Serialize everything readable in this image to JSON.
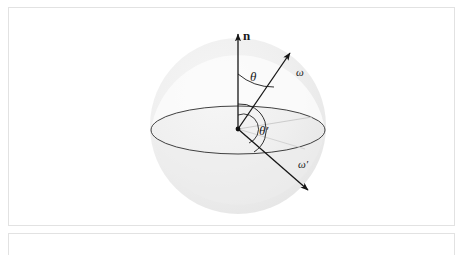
{
  "figure": {
    "caption": "",
    "type": "bsdf-hemisphere-geometry-diagram",
    "colors": {
      "sphere_fill": "#ebebeb",
      "sphere_fill_light": "#f4f4f4",
      "stroke": "#1a1a1a",
      "equator_stroke": "#2b2b2b",
      "projection_line": "#c9c9c9",
      "panel_border": "#e2e2e2",
      "background": "#ffffff"
    },
    "sphere": {
      "center_x": 237,
      "center_y": 118,
      "radius": 88
    },
    "equator": {
      "center_x": 237,
      "center_y": 122,
      "rx": 87,
      "ry": 24
    },
    "origin": {
      "x": 237,
      "y": 121
    },
    "vectors": [
      {
        "name": "normal-vector",
        "label": "n",
        "label_x": 241,
        "label_y": 32,
        "from_x": 237,
        "from_y": 121,
        "to_x": 237,
        "to_y": 24,
        "style": "bold-upright"
      },
      {
        "name": "incident-direction-vector",
        "label": "ω",
        "label_x": 293,
        "label_y": 67,
        "from_x": 237,
        "from_y": 121,
        "to_x": 288,
        "to_y": 46,
        "style": "italic"
      },
      {
        "name": "outgoing-direction-vector",
        "label": "ω′",
        "label_x": 296,
        "label_y": 160,
        "from_x": 237,
        "from_y": 121,
        "to_x": 307,
        "to_y": 182,
        "style": "italic"
      }
    ],
    "angles": [
      {
        "name": "theta-angle-arc",
        "label": "θ",
        "label_x": 247,
        "label_y": 72,
        "between": [
          "n",
          "ω"
        ]
      },
      {
        "name": "theta-prime-angle-arc",
        "label": "θ′",
        "label_x": 256,
        "label_y": 126,
        "between": [
          "n-downward",
          "ω′"
        ]
      }
    ]
  }
}
